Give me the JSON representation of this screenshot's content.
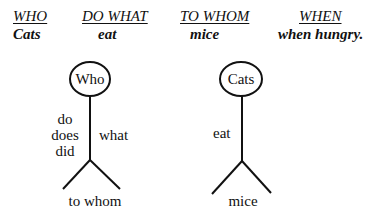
{
  "columns": [
    {
      "header": "WHO",
      "value": "Cats"
    },
    {
      "header": "DO WHAT",
      "value": "eat"
    },
    {
      "header": "TO WHOM",
      "value": "mice"
    },
    {
      "header": "WHEN",
      "value": "when hungry."
    }
  ],
  "figure_template": {
    "head": "Who",
    "left_labels": [
      "do",
      "does",
      "did"
    ],
    "right_label": "what",
    "feet": "to whom"
  },
  "figure_example": {
    "head": "Cats",
    "left_label": "eat",
    "feet": "mice"
  }
}
